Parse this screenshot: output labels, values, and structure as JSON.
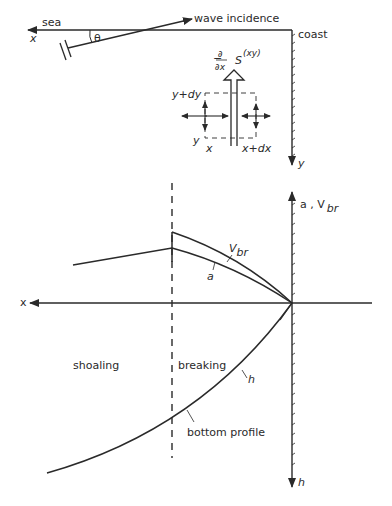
{
  "plan_view": {
    "sea_label": "sea",
    "x_axis_label": "x",
    "wave_incidence_label": "wave incidence",
    "angle_label": "θ",
    "coast_label": "coast",
    "y_axis_label": "y",
    "stress_gradient_prefix": "−",
    "partial_num": "∂",
    "partial_den": "∂x",
    "stress_symbol": "S",
    "stress_superscript": "(xy)",
    "element_top_label": "y+dy",
    "element_bottom_label": "y",
    "element_left_label": "x",
    "element_right_label": "x+dx"
  },
  "profile_view": {
    "x_axis_label": "x",
    "upper_axis_label": "a , V",
    "upper_axis_sub": "br",
    "lower_axis_label": "h",
    "curve_vbr_label": "V",
    "curve_vbr_sub": "br",
    "curve_a_label": "a",
    "curve_h_label": "h",
    "zone_shoaling": "shoaling",
    "zone_breaking": "breaking",
    "bottom_profile_label": "bottom profile"
  },
  "colors": {
    "line": "#2a2a2a",
    "background": "#ffffff"
  }
}
